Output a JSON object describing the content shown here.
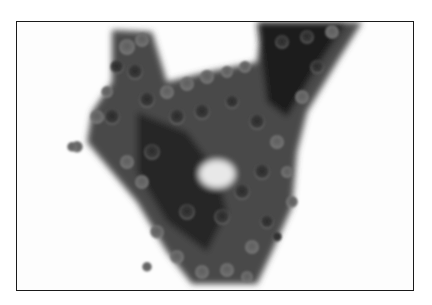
{
  "image": {
    "kind": "micrograph",
    "description": "Grayscale cytology micrograph of a dense V-shaped cluster of round cells on a white background, enclosed by a thin black frame",
    "colors": {
      "background": "#ffffff",
      "frame": "#1a1a1a",
      "cell_dark": "#1e1e1e",
      "cell_mid": "#5a5a5a",
      "cell_light": "#8c8c8c"
    }
  }
}
